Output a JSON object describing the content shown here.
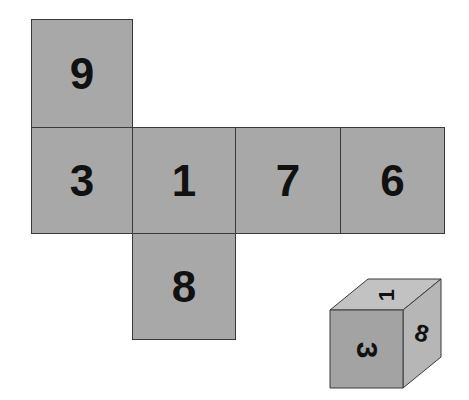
{
  "net": {
    "faces": [
      {
        "id": "top",
        "value": "9"
      },
      {
        "id": "left",
        "value": "3"
      },
      {
        "id": "center",
        "value": "1"
      },
      {
        "id": "right",
        "value": "7"
      },
      {
        "id": "far-right",
        "value": "6"
      },
      {
        "id": "bottom",
        "value": "8"
      }
    ]
  },
  "cube": {
    "front": "3",
    "top": "1",
    "side": "8"
  },
  "colors": {
    "face_fill": "#a8a8a8",
    "cube_front": "#a3a3a3",
    "cube_top": "#c2c2c2",
    "cube_side": "#b6b6b6",
    "outline": "#3a3a3a",
    "digit": "#111111"
  }
}
